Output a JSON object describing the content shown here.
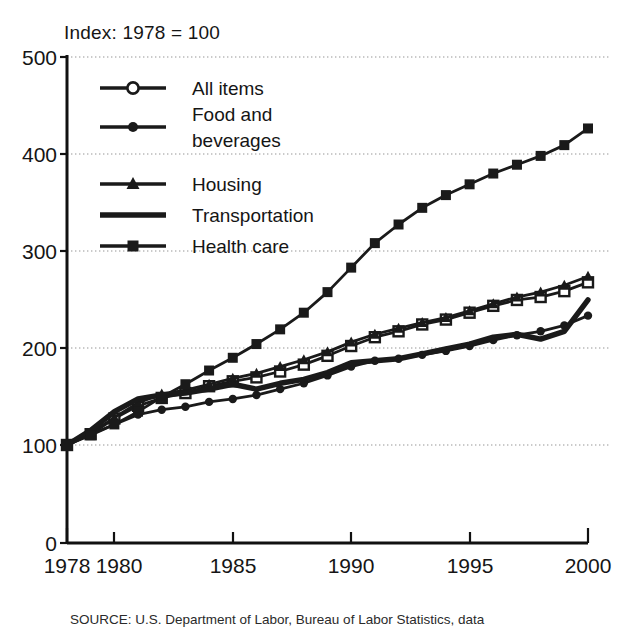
{
  "figure": {
    "index_note": "Index: 1978 = 100",
    "source_note": "SOURCE: U.S. Department of Labor, Bureau of Labor Statistics, data"
  },
  "axes": {
    "y_ticks": [
      "0",
      "100",
      "200",
      "300",
      "400",
      "500"
    ],
    "x_ticks": [
      "1978",
      "1980",
      "1985",
      "1990",
      "1995",
      "2000"
    ]
  },
  "legend": {
    "items": [
      {
        "label": "All items",
        "marker": "open-circle",
        "color": "#1a1a1a"
      },
      {
        "label": "Food and beverages",
        "label_line1": "Food and",
        "label_line2": "beverages",
        "marker": "filled-circle",
        "color": "#1a1a1a"
      },
      {
        "label": "Housing",
        "marker": "filled-triangle",
        "color": "#1a1a1a"
      },
      {
        "label": "Transportation",
        "marker": "thick-line",
        "color": "#1a1a1a"
      },
      {
        "label": "Health care",
        "marker": "filled-square",
        "color": "#1a1a1a"
      }
    ]
  },
  "chart_data": {
    "type": "line",
    "title": "",
    "subtitle": "Index: 1978 = 100",
    "xlabel": "",
    "ylabel": "",
    "xlim": [
      1978,
      2000
    ],
    "ylim": [
      0,
      500
    ],
    "y_ticks": [
      0,
      100,
      200,
      300,
      400,
      500
    ],
    "x_ticks": [
      1978,
      1980,
      1985,
      1990,
      1995,
      2000
    ],
    "grid": "horizontal-dotted",
    "legend_position": "upper-left-inside",
    "x": [
      1978,
      1979,
      1980,
      1981,
      1982,
      1983,
      1984,
      1985,
      1986,
      1987,
      1988,
      1989,
      1990,
      1991,
      1992,
      1993,
      1994,
      1995,
      1996,
      1997,
      1998,
      1999,
      2000
    ],
    "series": [
      {
        "name": "All items",
        "marker": "open-circle",
        "values": [
          100,
          111,
          127,
          140,
          148,
          153,
          160,
          165,
          169,
          175,
          182,
          191,
          201,
          210,
          216,
          223,
          228,
          235,
          242,
          248,
          251,
          257,
          266
        ]
      },
      {
        "name": "Food and beverages",
        "marker": "filled-circle",
        "values": [
          100,
          111,
          121,
          131,
          136,
          139,
          144,
          147,
          151,
          157,
          163,
          171,
          180,
          186,
          188,
          192,
          196,
          201,
          207,
          212,
          216,
          222,
          232
        ]
      },
      {
        "name": "Housing",
        "marker": "filled-triangle",
        "values": [
          100,
          112,
          128,
          143,
          152,
          156,
          162,
          168,
          173,
          180,
          187,
          195,
          205,
          213,
          219,
          225,
          230,
          237,
          244,
          251,
          256,
          263,
          272
        ]
      },
      {
        "name": "Transportation",
        "marker": "none",
        "values": [
          100,
          115,
          134,
          147,
          151,
          153,
          157,
          162,
          157,
          163,
          167,
          174,
          184,
          186,
          188,
          193,
          198,
          203,
          210,
          213,
          208,
          216,
          248
        ]
      },
      {
        "name": "Health care",
        "marker": "filled-square",
        "values": [
          100,
          110,
          121,
          134,
          149,
          162,
          176,
          189,
          203,
          218,
          235,
          256,
          281,
          306,
          325,
          342,
          355,
          366,
          377,
          386,
          395,
          406,
          423
        ]
      }
    ]
  }
}
